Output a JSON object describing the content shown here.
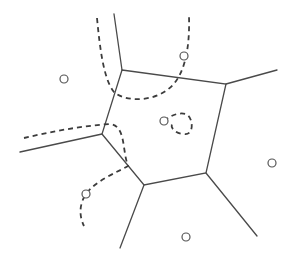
{
  "diagram": {
    "type": "voronoi-cell-with-paths",
    "colors": {
      "background": "#ffffff",
      "edge": "#4a4a4a",
      "dashed_path": "#3c3c3c",
      "site": "#555555"
    },
    "cell_vertices": [
      [
        122,
        70
      ],
      [
        226,
        84
      ],
      [
        206,
        173
      ],
      [
        144,
        185
      ],
      [
        102,
        134
      ]
    ],
    "rays": [
      {
        "from": [
          122,
          70
        ],
        "to": [
          114,
          14
        ]
      },
      {
        "from": [
          226,
          84
        ],
        "to": [
          277,
          70
        ]
      },
      {
        "from": [
          206,
          173
        ],
        "to": [
          257,
          236
        ]
      },
      {
        "from": [
          144,
          185
        ],
        "to": [
          120,
          248
        ]
      },
      {
        "from": [
          102,
          134
        ],
        "to": [
          20,
          152
        ]
      }
    ],
    "sites": [
      {
        "id": "site-outer-top-left",
        "x": 64,
        "y": 79
      },
      {
        "id": "site-top-right",
        "x": 184,
        "y": 56
      },
      {
        "id": "site-center",
        "x": 164,
        "y": 121
      },
      {
        "id": "site-outer-right",
        "x": 272,
        "y": 163
      },
      {
        "id": "site-outer-bottom",
        "x": 186,
        "y": 237
      },
      {
        "id": "site-bottom-left",
        "x": 86,
        "y": 194
      }
    ],
    "dashed_paths": [
      {
        "id": "path-top",
        "d": "M97,18 C100,50 104,80 114,92 C128,104 164,102 178,78 C184,68 190,50 189,16"
      },
      {
        "id": "path-left",
        "d": "M24,138 C50,132 80,126 110,124 C126,126 122,150 128,166 C118,172 96,180 86,194 C78,206 80,218 84,226"
      },
      {
        "id": "path-center-loop",
        "d": "M164,121 C170,116 178,112 186,114 C194,118 194,136 184,134 C176,134 170,128 172,124"
      }
    ]
  }
}
